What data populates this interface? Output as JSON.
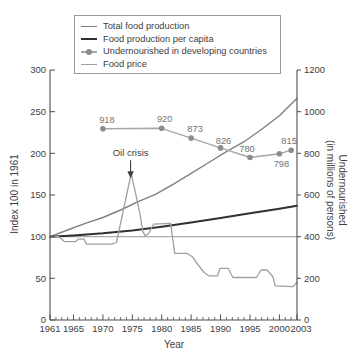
{
  "chart_data": {
    "type": "line",
    "xlabel": "Year",
    "ylabel_left": "Index 100 in 1961",
    "ylabel_right_line1": "Undernourished",
    "ylabel_right_line2": "(in millions of persons)",
    "x_range": [
      1961,
      2003
    ],
    "x_ticks": [
      1961,
      1965,
      1970,
      1975,
      1980,
      1985,
      1990,
      1995,
      2000,
      2003
    ],
    "x_minor_tick_step": 1,
    "y_left_range": [
      0,
      300
    ],
    "y_left_ticks": [
      0,
      50,
      100,
      150,
      200,
      250,
      300
    ],
    "y_right_range": [
      0,
      1200
    ],
    "y_right_ticks": [
      0,
      200,
      400,
      600,
      800,
      1000,
      1200
    ],
    "reference_line_left_value": 100,
    "grid": false,
    "legend_position": "top",
    "colors": {
      "axis": "#4d4d4d",
      "text": "#404040",
      "reference_line": "#8c8c8c",
      "data_label_text": "#757575",
      "annotation_text": "#3d3d3d"
    },
    "annotation": {
      "label": "Oil crisis",
      "year": 1974.7,
      "value_left": 176
    },
    "legend": [
      {
        "label": "Total food production",
        "color": "#808080",
        "width": 1.4,
        "marker": false
      },
      {
        "label": "Food production per capita",
        "color": "#303030",
        "width": 2.0,
        "marker": false
      },
      {
        "label": "Undernourished in developing countries",
        "color": "#a6a6a6",
        "width": 1.4,
        "marker": true,
        "marker_color": "#8c8c8c"
      },
      {
        "label": "Food price",
        "color": "#a0a0a0",
        "width": 1.3,
        "marker": false
      }
    ],
    "series": [
      {
        "name": "Total food production",
        "axis": "left",
        "color": "#808080",
        "width": 1.4,
        "points": [
          [
            1961,
            100
          ],
          [
            1964,
            108
          ],
          [
            1967,
            116
          ],
          [
            1970,
            123
          ],
          [
            1973,
            132
          ],
          [
            1976,
            142
          ],
          [
            1979,
            151
          ],
          [
            1982,
            163
          ],
          [
            1985,
            176
          ],
          [
            1988,
            189
          ],
          [
            1991,
            202
          ],
          [
            1994,
            214
          ],
          [
            1997,
            229
          ],
          [
            2000,
            245
          ],
          [
            2003,
            266
          ]
        ]
      },
      {
        "name": "Food production per capita",
        "axis": "left",
        "color": "#303030",
        "width": 2.0,
        "points": [
          [
            1961,
            100
          ],
          [
            1965,
            101.5
          ],
          [
            1970,
            104
          ],
          [
            1975,
            107.5
          ],
          [
            1980,
            112
          ],
          [
            1985,
            117
          ],
          [
            1990,
            122.5
          ],
          [
            1995,
            128
          ],
          [
            2000,
            133.5
          ],
          [
            2003,
            137
          ]
        ]
      },
      {
        "name": "Undernourished in developing countries",
        "axis": "right",
        "color": "#a6a6a6",
        "width": 1.4,
        "marker": true,
        "marker_color": "#8c8c8c",
        "marker_radius": 2.8,
        "points": [
          [
            1970,
            918
          ],
          [
            1980,
            920
          ],
          [
            1985,
            873
          ],
          [
            1990,
            826
          ],
          [
            1995,
            780
          ],
          [
            2000,
            798
          ],
          [
            2002,
            815
          ]
        ],
        "point_labels": [
          "918",
          "920",
          "873",
          "826",
          "780",
          "798",
          "815"
        ],
        "label_offsets": [
          [
            4,
            -6
          ],
          [
            3,
            -6
          ],
          [
            4,
            -6
          ],
          [
            3,
            -4
          ],
          [
            -3,
            -6
          ],
          [
            2,
            13
          ],
          [
            -2,
            -6
          ]
        ]
      },
      {
        "name": "Food price",
        "axis": "left",
        "color": "#a0a0a0",
        "width": 1.3,
        "points": [
          [
            1961,
            100
          ],
          [
            1962.5,
            100
          ],
          [
            1963.5,
            94
          ],
          [
            1965.3,
            94
          ],
          [
            1965.8,
            97
          ],
          [
            1966.8,
            97
          ],
          [
            1967.2,
            91
          ],
          [
            1971.5,
            91
          ],
          [
            1972.3,
            93
          ],
          [
            1974.8,
            176
          ],
          [
            1976.2,
            131
          ],
          [
            1976.8,
            106
          ],
          [
            1977.2,
            101
          ],
          [
            1977.8,
            104
          ],
          [
            1978.6,
            115
          ],
          [
            1981.5,
            116
          ],
          [
            1982.2,
            80
          ],
          [
            1984.3,
            80
          ],
          [
            1985.2,
            76
          ],
          [
            1986.2,
            66
          ],
          [
            1987.2,
            57
          ],
          [
            1988,
            53
          ],
          [
            1989.5,
            53
          ],
          [
            1989.9,
            62
          ],
          [
            1991.3,
            62
          ],
          [
            1992.1,
            51
          ],
          [
            1996.1,
            51
          ],
          [
            1996.9,
            60
          ],
          [
            1997.9,
            60
          ],
          [
            1998.9,
            52
          ],
          [
            1999.3,
            41
          ],
          [
            2002.3,
            40
          ],
          [
            2003,
            45
          ]
        ]
      }
    ]
  }
}
